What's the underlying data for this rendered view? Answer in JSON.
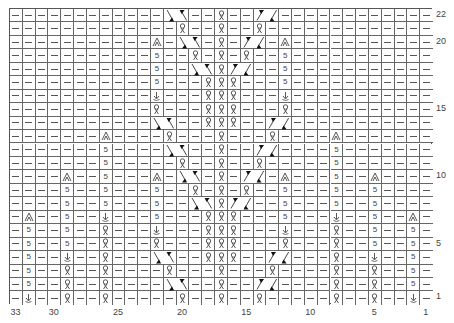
{
  "chart": {
    "columns": 33,
    "rows": 22,
    "row_labels": [
      {
        "row": 1,
        "label": "1"
      },
      {
        "row": 5,
        "label": "5"
      },
      {
        "row": 10,
        "label": "10"
      },
      {
        "row": 15,
        "label": "15"
      },
      {
        "row": 20,
        "label": "20"
      },
      {
        "row": 22,
        "label": "22"
      }
    ],
    "col_labels": [
      {
        "col": 33,
        "label": "33"
      },
      {
        "col": 30,
        "label": "30"
      },
      {
        "col": 25,
        "label": "25"
      },
      {
        "col": 20,
        "label": "20"
      },
      {
        "col": 15,
        "label": "15"
      },
      {
        "col": 10,
        "label": "10"
      },
      {
        "col": 5,
        "label": "5"
      },
      {
        "col": 1,
        "label": "1"
      }
    ],
    "symbols": {
      "purl": "—",
      "tbl": "knit-through-back-loop",
      "five": "5",
      "arrow": "↓",
      "peak": "⩓",
      "cableR": "right-cross-cable",
      "cableL": "left-cross-cable"
    },
    "rows_data": {
      "22": [
        [
          12,
          "cableR"
        ],
        [
          16,
          "tbl"
        ],
        [
          19,
          "cableL"
        ]
      ],
      "21": [
        [
          13,
          "tbl"
        ],
        [
          16,
          "tbl"
        ],
        [
          19,
          "tbl"
        ]
      ],
      "20": [
        [
          11,
          "peak"
        ],
        [
          13,
          "cableR"
        ],
        [
          16,
          "tbl"
        ],
        [
          18,
          "cableL"
        ],
        [
          21,
          "peak"
        ]
      ],
      "19": [
        [
          11,
          "five"
        ],
        [
          14,
          "tbl"
        ],
        [
          16,
          "tbl"
        ],
        [
          18,
          "tbl"
        ],
        [
          21,
          "five"
        ]
      ],
      "18": [
        [
          11,
          "five"
        ],
        [
          14,
          "cableR"
        ],
        [
          16,
          "tbl"
        ],
        [
          17,
          "cableL"
        ],
        [
          21,
          "five"
        ]
      ],
      "17": [
        [
          11,
          "five"
        ],
        [
          15,
          "tbl"
        ],
        [
          16,
          "tbl"
        ],
        [
          17,
          "tbl"
        ],
        [
          21,
          "five"
        ]
      ],
      "16": [
        [
          11,
          "arrow"
        ],
        [
          15,
          "tbl"
        ],
        [
          16,
          "tbl"
        ],
        [
          17,
          "tbl"
        ],
        [
          21,
          "arrow"
        ]
      ],
      "15": [
        [
          11,
          "tbl"
        ],
        [
          15,
          "tbl"
        ],
        [
          16,
          "tbl"
        ],
        [
          17,
          "tbl"
        ],
        [
          21,
          "tbl"
        ]
      ],
      "14": [
        [
          11,
          "cableR"
        ],
        [
          15,
          "tbl"
        ],
        [
          16,
          "tbl"
        ],
        [
          17,
          "tbl"
        ],
        [
          20,
          "cableL"
        ]
      ],
      "13": [
        [
          7,
          "peak"
        ],
        [
          12,
          "tbl"
        ],
        [
          16,
          "tbl"
        ],
        [
          20,
          "tbl"
        ],
        [
          25,
          "peak"
        ]
      ],
      "12": [
        [
          7,
          "five"
        ],
        [
          12,
          "cableR"
        ],
        [
          16,
          "tbl"
        ],
        [
          19,
          "cableL"
        ],
        [
          25,
          "five"
        ]
      ],
      "11": [
        [
          7,
          "five"
        ],
        [
          13,
          "tbl"
        ],
        [
          16,
          "tbl"
        ],
        [
          19,
          "tbl"
        ],
        [
          25,
          "five"
        ]
      ],
      "10": [
        [
          4,
          "peak"
        ],
        [
          7,
          "five"
        ],
        [
          11,
          "peak"
        ],
        [
          13,
          "cableR"
        ],
        [
          16,
          "tbl"
        ],
        [
          18,
          "cableL"
        ],
        [
          21,
          "peak"
        ],
        [
          25,
          "five"
        ],
        [
          28,
          "peak"
        ]
      ],
      "9": [
        [
          4,
          "five"
        ],
        [
          7,
          "five"
        ],
        [
          11,
          "five"
        ],
        [
          14,
          "tbl"
        ],
        [
          16,
          "tbl"
        ],
        [
          18,
          "tbl"
        ],
        [
          21,
          "five"
        ],
        [
          25,
          "five"
        ],
        [
          28,
          "five"
        ]
      ],
      "8": [
        [
          4,
          "five"
        ],
        [
          7,
          "five"
        ],
        [
          11,
          "five"
        ],
        [
          14,
          "cableR"
        ],
        [
          16,
          "tbl"
        ],
        [
          17,
          "cableL"
        ],
        [
          21,
          "five"
        ],
        [
          25,
          "five"
        ],
        [
          28,
          "five"
        ]
      ],
      "7": [
        [
          1,
          "peak"
        ],
        [
          4,
          "five"
        ],
        [
          7,
          "arrow"
        ],
        [
          11,
          "five"
        ],
        [
          15,
          "tbl"
        ],
        [
          16,
          "tbl"
        ],
        [
          17,
          "tbl"
        ],
        [
          21,
          "five"
        ],
        [
          25,
          "arrow"
        ],
        [
          28,
          "five"
        ],
        [
          31,
          "peak"
        ]
      ],
      "6": [
        [
          1,
          "five"
        ],
        [
          4,
          "five"
        ],
        [
          7,
          "tbl"
        ],
        [
          11,
          "arrow"
        ],
        [
          15,
          "tbl"
        ],
        [
          16,
          "tbl"
        ],
        [
          17,
          "tbl"
        ],
        [
          21,
          "arrow"
        ],
        [
          25,
          "tbl"
        ],
        [
          28,
          "five"
        ],
        [
          31,
          "five"
        ]
      ],
      "5": [
        [
          1,
          "five"
        ],
        [
          4,
          "five"
        ],
        [
          7,
          "tbl"
        ],
        [
          11,
          "tbl"
        ],
        [
          15,
          "tbl"
        ],
        [
          16,
          "tbl"
        ],
        [
          17,
          "tbl"
        ],
        [
          21,
          "tbl"
        ],
        [
          25,
          "tbl"
        ],
        [
          28,
          "five"
        ],
        [
          31,
          "five"
        ]
      ],
      "4": [
        [
          1,
          "five"
        ],
        [
          4,
          "arrow"
        ],
        [
          7,
          "tbl"
        ],
        [
          11,
          "cableR"
        ],
        [
          15,
          "tbl"
        ],
        [
          16,
          "tbl"
        ],
        [
          17,
          "tbl"
        ],
        [
          20,
          "cableL"
        ],
        [
          25,
          "tbl"
        ],
        [
          28,
          "arrow"
        ],
        [
          31,
          "five"
        ]
      ],
      "3": [
        [
          1,
          "five"
        ],
        [
          4,
          "tbl"
        ],
        [
          7,
          "tbl"
        ],
        [
          12,
          "tbl"
        ],
        [
          16,
          "tbl"
        ],
        [
          20,
          "tbl"
        ],
        [
          25,
          "tbl"
        ],
        [
          28,
          "tbl"
        ],
        [
          31,
          "five"
        ]
      ],
      "2": [
        [
          1,
          "five"
        ],
        [
          4,
          "tbl"
        ],
        [
          7,
          "tbl"
        ],
        [
          12,
          "cableR"
        ],
        [
          16,
          "tbl"
        ],
        [
          19,
          "cableL"
        ],
        [
          25,
          "tbl"
        ],
        [
          28,
          "tbl"
        ],
        [
          31,
          "five"
        ]
      ],
      "1": [
        [
          1,
          "arrow"
        ],
        [
          4,
          "tbl"
        ],
        [
          7,
          "tbl"
        ],
        [
          13,
          "tbl"
        ],
        [
          16,
          "tbl"
        ],
        [
          19,
          "tbl"
        ],
        [
          25,
          "tbl"
        ],
        [
          28,
          "tbl"
        ],
        [
          31,
          "arrow"
        ]
      ]
    }
  }
}
